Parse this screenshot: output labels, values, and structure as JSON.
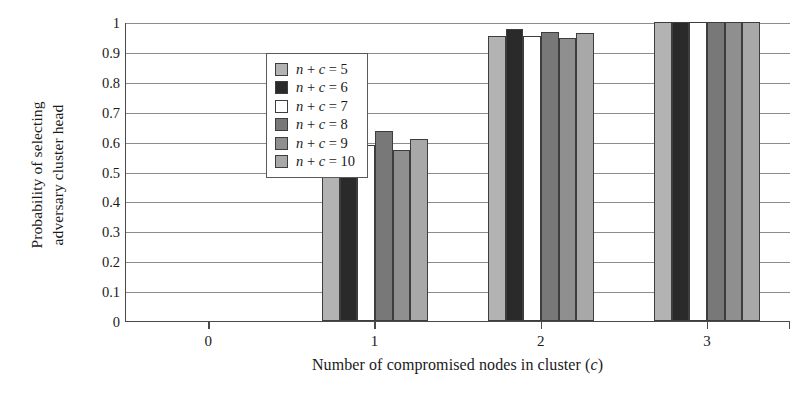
{
  "chart_data": {
    "type": "bar",
    "title": "",
    "xlabel": "Number of compromised nodes in cluster (c)",
    "xlabel_parts": {
      "main": "Number of compromised nodes in cluster (",
      "italic": "c",
      "tail": ")"
    },
    "ylabel": "Probability of selecting adversary cluster head",
    "ylabel_lines": [
      "Probability of selecting",
      "adversary cluster head"
    ],
    "categories": [
      "0",
      "1",
      "2",
      "3"
    ],
    "x": [
      0,
      1,
      2,
      3
    ],
    "ylim": [
      0,
      1
    ],
    "xlim_note": "categorical, 4 groups of 6 bars",
    "yticks": [
      "1",
      "0.9",
      "0.8",
      "0.7",
      "0.6",
      "0.5",
      "0.4",
      "0.3",
      "0.2",
      "0.1",
      "0"
    ],
    "ytick_values": [
      1,
      0.9,
      0.8,
      0.7,
      0.6,
      0.5,
      0.4,
      0.3,
      0.2,
      0.1,
      0
    ],
    "grid": "horizontal",
    "legend_position": "upper-left inside plot",
    "series": [
      {
        "name": "n + c = 5",
        "label_parts": {
          "n": "n",
          "plus": " + ",
          "c": "c",
          "eq": " = ",
          "val": "5"
        },
        "color": "#b3b3b3",
        "values": [
          0,
          0.625,
          0.952,
          1.0
        ]
      },
      {
        "name": "n + c = 6",
        "label_parts": {
          "n": "n",
          "plus": " + ",
          "c": "c",
          "eq": " = ",
          "val": "6"
        },
        "color": "#2a2a2a",
        "values": [
          0,
          0.685,
          0.977,
          1.0
        ]
      },
      {
        "name": "n + c = 7",
        "label_parts": {
          "n": "n",
          "plus": " + ",
          "c": "c",
          "eq": " = ",
          "val": "7"
        },
        "color": "#ffffff",
        "values": [
          0,
          0.59,
          0.952,
          1.0
        ]
      },
      {
        "name": "n + c = 8",
        "label_parts": {
          "n": "n",
          "plus": " + ",
          "c": "c",
          "eq": " = ",
          "val": "8"
        },
        "color": "#787878",
        "values": [
          0,
          0.635,
          0.965,
          1.0
        ]
      },
      {
        "name": "n + c = 9",
        "label_parts": {
          "n": "n",
          "plus": " + ",
          "c": "c",
          "eq": " = ",
          "val": "9"
        },
        "color": "#8f8f8f",
        "values": [
          0,
          0.573,
          0.947,
          1.0
        ]
      },
      {
        "name": "n + c = 10",
        "label_parts": {
          "n": "n",
          "plus": " + ",
          "c": "c",
          "eq": " = ",
          "val": "10"
        },
        "color": "#a8a8a8",
        "values": [
          0,
          0.61,
          0.962,
          1.0
        ]
      }
    ],
    "colors": {
      "axis": "#4a4a4a",
      "grid": "#8c8c8c",
      "bar_edge": "#3d3d3d",
      "background": "#ffffff",
      "text": "#1a1a1a"
    }
  }
}
